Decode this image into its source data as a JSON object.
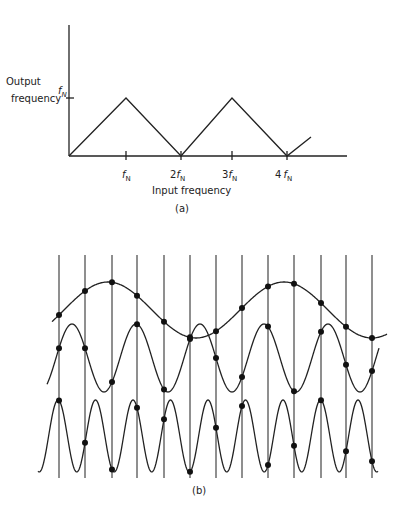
{
  "panel_a": {
    "y_label_line1": "Output",
    "y_label_line2": "frequency",
    "y_tick_label": "f",
    "y_tick_sub": "N",
    "x_label": "Input frequency",
    "caption": "(a)",
    "x_ticks": [
      {
        "prefix": "",
        "symbol": "f",
        "sub": "N"
      },
      {
        "prefix": "2",
        "symbol": "f",
        "sub": "N"
      },
      {
        "prefix": "3",
        "symbol": "f",
        "sub": "N"
      },
      {
        "prefix": "4",
        "symbol": "f",
        "sub": "N"
      }
    ]
  },
  "panel_b": {
    "caption": "(b)",
    "sample_lines": 13,
    "waves": [
      {
        "name": "low-frequency",
        "center": 310,
        "amp": 28,
        "period": 176,
        "phase_x": 108
      },
      {
        "name": "mid-frequency",
        "center": 358,
        "amp": 34,
        "period": 64,
        "phase_x": 72
      },
      {
        "name": "high-frequency",
        "center": 436,
        "amp": 36,
        "period": 37.5,
        "phase_x": 58
      }
    ]
  },
  "chart_data": [
    {
      "type": "line",
      "title": "(a)",
      "xlabel": "Input frequency",
      "ylabel": "Output frequency",
      "x_ticks": [
        "fN",
        "2fN",
        "3fN",
        "4fN"
      ],
      "y_ticks": [
        "fN"
      ],
      "x": [
        0,
        1,
        2,
        3,
        4,
        4.45
      ],
      "y": [
        0,
        1,
        0,
        1,
        0,
        0.45
      ],
      "description": "Folded (aliased) output frequency vs input frequency; triangular sawtooth with peaks at odd multiples of fN"
    },
    {
      "type": "line",
      "title": "(b)",
      "description": "Three sinusoids sampled at 13 equally spaced instants (vertical lines); sampled points marked with dots",
      "series": [
        {
          "name": "low-frequency sinusoid",
          "cycles_shown": 1.9
        },
        {
          "name": "mid-frequency sinusoid",
          "cycles_shown": 5.2
        },
        {
          "name": "high-frequency sinusoid",
          "cycles_shown": 9
        }
      ],
      "sample_x_px": [
        59,
        85,
        112,
        137,
        164,
        190,
        216,
        242,
        268,
        294,
        321,
        346,
        372
      ]
    }
  ]
}
